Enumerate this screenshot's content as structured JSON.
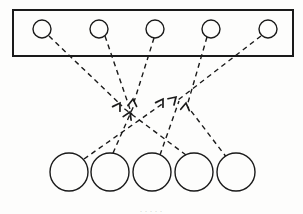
{
  "figure": {
    "caption": ". . . . .",
    "background_color": "#fdfdfc",
    "ink_color": "#1a1a1a",
    "stroke_width": 1.4,
    "dash_pattern": "5,4"
  },
  "container_box": {
    "label": "upper-layer-enclosure",
    "x": 13,
    "y": 10,
    "width": 280,
    "height": 46,
    "stroke": "#1a1a1a",
    "stroke_width": 2,
    "fill": "none"
  },
  "top_row": {
    "label": "upper layer nodes",
    "count": 5,
    "radius": 9,
    "center_y": 29,
    "nodes": [
      {
        "id": "t1",
        "cx": 42,
        "cy": 29,
        "r": 9
      },
      {
        "id": "t2",
        "cx": 99,
        "cy": 29,
        "r": 9
      },
      {
        "id": "t3",
        "cx": 155,
        "cy": 29,
        "r": 9
      },
      {
        "id": "t4",
        "cx": 211,
        "cy": 29,
        "r": 9
      },
      {
        "id": "t5",
        "cx": 268,
        "cy": 29,
        "r": 9
      }
    ]
  },
  "bottom_row": {
    "label": "lower layer nodes",
    "count": 5,
    "radius": 19,
    "center_y": 172,
    "nodes": [
      {
        "id": "b1",
        "cx": 69,
        "cy": 172,
        "r": 19
      },
      {
        "id": "b2",
        "cx": 110,
        "cy": 172,
        "r": 19
      },
      {
        "id": "b3",
        "cx": 152,
        "cy": 172,
        "r": 19
      },
      {
        "id": "b4",
        "cx": 194,
        "cy": 172,
        "r": 19
      },
      {
        "id": "b5",
        "cx": 236,
        "cy": 172,
        "r": 19
      }
    ]
  },
  "arrowheads": {
    "label": "upward arrowheads at line termini",
    "count": 6,
    "size": 7,
    "items": [
      {
        "id": "a1",
        "x": 120,
        "y": 103,
        "angle": -58
      },
      {
        "id": "a2",
        "x": 133,
        "y": 99,
        "angle": -84
      },
      {
        "id": "a3",
        "x": 130,
        "y": 112,
        "angle": -66
      },
      {
        "id": "a4",
        "x": 163,
        "y": 99,
        "angle": -58
      },
      {
        "id": "a5",
        "x": 176,
        "y": 97,
        "angle": -44
      },
      {
        "id": "a6",
        "x": 186,
        "y": 103,
        "angle": -82
      }
    ]
  },
  "edges": {
    "label": "dashed connection lines",
    "count": 10,
    "items": [
      {
        "id": "e1",
        "from": "t1",
        "to": "arrow-a1",
        "x1": 49,
        "y1": 36,
        "x2": 122,
        "y2": 106
      },
      {
        "id": "e2",
        "from": "t2",
        "to": "arrow-a3",
        "x1": 105,
        "y1": 36,
        "x2": 132,
        "y2": 115
      },
      {
        "id": "e3",
        "from": "t3",
        "to": "arrow-a2",
        "x1": 154,
        "y1": 38,
        "x2": 134,
        "y2": 102
      },
      {
        "id": "e4",
        "from": "t4",
        "to": "arrow-a6",
        "x1": 207,
        "y1": 37,
        "x2": 187,
        "y2": 106
      },
      {
        "id": "e5",
        "from": "t5",
        "to": "arrow-a5",
        "x1": 261,
        "y1": 36,
        "x2": 178,
        "y2": 100
      },
      {
        "id": "e6",
        "from": "b1",
        "to": "arrow-a4",
        "x1": 84,
        "y1": 159,
        "x2": 165,
        "y2": 102
      },
      {
        "id": "e7",
        "from": "b2",
        "to": "arrow-a2",
        "x1": 113,
        "y1": 153,
        "x2": 135,
        "y2": 103
      },
      {
        "id": "e8",
        "from": "b3",
        "to": "arrow-a5",
        "x1": 160,
        "y1": 155,
        "x2": 179,
        "y2": 101
      },
      {
        "id": "e9",
        "from": "b4",
        "to": "arrow-a1",
        "x1": 186,
        "y1": 155,
        "x2": 122,
        "y2": 107
      },
      {
        "id": "e10",
        "from": "b5",
        "to": "arrow-a6",
        "x1": 227,
        "y1": 158,
        "x2": 188,
        "y2": 107
      }
    ]
  }
}
